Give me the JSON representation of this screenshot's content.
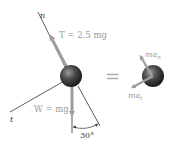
{
  "diagram": {
    "left_fbd": {
      "n_axis_label": "n",
      "t_axis_label": "t",
      "tension_label": "T = 2.5 mg",
      "weight_label": "W = mg",
      "angle_label": "30°"
    },
    "equals_sign": "=",
    "right_kd": {
      "normal_accel_label": "ma",
      "normal_accel_sub": "n",
      "tangential_accel_label": "ma",
      "tangential_accel_sub": "t"
    },
    "colors": {
      "arrow": "#9e9e9e",
      "line": "#333333",
      "ball_dark": "#1e1e1e",
      "ball_light": "#8a8a8a",
      "text": "#9a9a9a"
    }
  }
}
